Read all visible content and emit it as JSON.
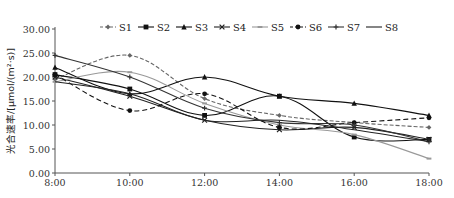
{
  "chart_data": {
    "type": "line",
    "title": "",
    "xlabel": "",
    "ylabel": "光合速率/[μmol/(m²·s)]",
    "x": [
      "8:00",
      "10:00",
      "12:00",
      "14:00",
      "16:00",
      "18:00"
    ],
    "ylim": [
      0,
      30
    ],
    "yticks": [
      "0.00",
      "5.00",
      "10.00",
      "15.00",
      "20.00",
      "25.00",
      "30.00"
    ],
    "grid": false,
    "legend_position": "top",
    "smooth": true,
    "series": [
      {
        "name": "S1",
        "values": [
          19.5,
          24.5,
          15.5,
          12.0,
          10.5,
          9.5
        ],
        "color": "#666666",
        "dash": "4,2",
        "marker": "diamond"
      },
      {
        "name": "S2",
        "values": [
          20.5,
          17.5,
          12.0,
          16.0,
          7.5,
          7.0
        ],
        "color": "#111111",
        "dash": "",
        "marker": "square"
      },
      {
        "name": "S3",
        "values": [
          22.0,
          16.5,
          20.0,
          16.0,
          14.5,
          12.0
        ],
        "color": "#111111",
        "dash": "",
        "marker": "triangle"
      },
      {
        "name": "S4",
        "values": [
          20.0,
          16.0,
          11.0,
          9.0,
          9.5,
          7.0
        ],
        "color": "#222222",
        "dash": "",
        "marker": "x"
      },
      {
        "name": "S5",
        "values": [
          19.0,
          21.0,
          14.5,
          10.0,
          8.0,
          3.0
        ],
        "color": "#999999",
        "dash": "",
        "marker": "dash"
      },
      {
        "name": "S6",
        "values": [
          20.5,
          13.0,
          16.5,
          9.5,
          10.5,
          11.5
        ],
        "color": "#111111",
        "dash": "5,3",
        "marker": "circle"
      },
      {
        "name": "S7",
        "values": [
          24.5,
          20.0,
          13.5,
          10.5,
          10.0,
          6.5
        ],
        "color": "#333333",
        "dash": "",
        "marker": "plus"
      },
      {
        "name": "S8",
        "values": [
          19.0,
          16.5,
          11.0,
          11.0,
          9.0,
          6.5
        ],
        "color": "#222222",
        "dash": "",
        "marker": "none"
      }
    ]
  }
}
